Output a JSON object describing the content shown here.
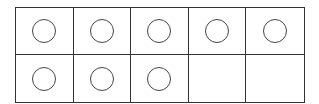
{
  "ten_frame": {
    "rows": 2,
    "columns": 5,
    "filled_count": 8,
    "total_cells": 10,
    "cells": [
      {
        "row": 1,
        "col": 1,
        "counter": true
      },
      {
        "row": 1,
        "col": 2,
        "counter": true
      },
      {
        "row": 1,
        "col": 3,
        "counter": true
      },
      {
        "row": 1,
        "col": 4,
        "counter": true
      },
      {
        "row": 1,
        "col": 5,
        "counter": true
      },
      {
        "row": 2,
        "col": 1,
        "counter": true
      },
      {
        "row": 2,
        "col": 2,
        "counter": true
      },
      {
        "row": 2,
        "col": 3,
        "counter": true
      },
      {
        "row": 2,
        "col": 4,
        "counter": false
      },
      {
        "row": 2,
        "col": 5,
        "counter": false
      }
    ],
    "colors": {
      "line": "#333333",
      "counter_stroke": "#444444",
      "background": "#ffffff"
    }
  }
}
